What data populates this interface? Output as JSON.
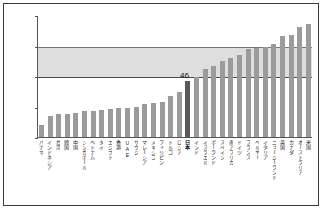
{
  "chart_data": {
    "type": "bar",
    "title": "",
    "xlabel": "",
    "ylabel": "",
    "ylim": [
      0,
      100
    ],
    "yticks": [
      0,
      25,
      50,
      75,
      100
    ],
    "grid": false,
    "legend": null,
    "highlight_label": "46",
    "highlight_category": "日本",
    "band": {
      "from": 50,
      "to": 75,
      "color": "#dedede"
    },
    "bar_color": "#9b9b9b",
    "highlight_color": "#595959",
    "categories": [
      "パナマ",
      "インドネシア",
      "台湾",
      "韓国",
      "中国",
      "シンガポール",
      "ベトナム",
      "タイ",
      "エジプト",
      "香港",
      "UAE",
      "サウジ",
      "マレーシア",
      "メキシコ",
      "フィリピン",
      "トルコ",
      "ロシア",
      "日本",
      "インド",
      "イスラエル",
      "ポーランド",
      "スペイン",
      "南アフリカ",
      "ドイツ",
      "フランス",
      "ベルギー",
      "イタリア",
      "ニュージーランド",
      "英国",
      "カナダ",
      "オーストラリア",
      "米国"
    ],
    "values": [
      10,
      17,
      19,
      19,
      20,
      21,
      21,
      22,
      23,
      24,
      24,
      25,
      27,
      28,
      29,
      34,
      37,
      46,
      49,
      56,
      58,
      62,
      65,
      67,
      72,
      73,
      74,
      76,
      83,
      84,
      90,
      93
    ]
  }
}
